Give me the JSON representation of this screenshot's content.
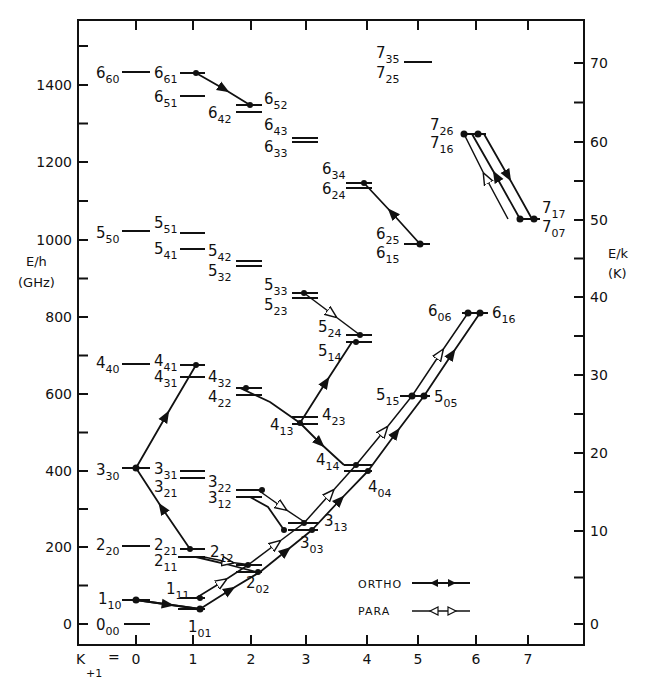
{
  "chart_data": {
    "type": "energy-level-diagram",
    "title": "",
    "x_axis": {
      "label": "K+1 =",
      "ticks": [
        "0",
        "1",
        "2",
        "3",
        "4",
        "5",
        "6",
        "7"
      ]
    },
    "y_axis_left": {
      "label": "E/h",
      "unit": "(GHz)",
      "ticks": [
        "0",
        "200",
        "400",
        "600",
        "800",
        "1000",
        "1200",
        "1400"
      ],
      "range": [
        -50,
        1560
      ]
    },
    "y_axis_right": {
      "label": "E/k",
      "unit": "(K)",
      "ticks": [
        "0",
        "10",
        "20",
        "30",
        "40",
        "50",
        "60",
        "70"
      ]
    },
    "legend": [
      {
        "name": "ORTHO",
        "style": "filled-arrows"
      },
      {
        "name": "PARA",
        "style": "open-arrows"
      }
    ],
    "levels": [
      {
        "J": "0",
        "sub": "00",
        "E_GHz": 0,
        "K": 0
      },
      {
        "J": "1",
        "sub": "10",
        "E_GHz": 60,
        "K": 0
      },
      {
        "J": "1",
        "sub": "11",
        "E_GHz": 68,
        "K": 1
      },
      {
        "J": "1",
        "sub": "01",
        "E_GHz": 36,
        "K": 1
      },
      {
        "J": "2",
        "sub": "20",
        "E_GHz": 203,
        "K": 0
      },
      {
        "J": "2",
        "sub": "21",
        "E_GHz": 195,
        "K": 1
      },
      {
        "J": "2",
        "sub": "11",
        "E_GHz": 171,
        "K": 1
      },
      {
        "J": "2",
        "sub": "12",
        "E_GHz": 153,
        "K": 2
      },
      {
        "J": "2",
        "sub": "02",
        "E_GHz": 132,
        "K": 2
      },
      {
        "J": "3",
        "sub": "30",
        "E_GHz": 404,
        "K": 0
      },
      {
        "J": "3",
        "sub": "31",
        "E_GHz": 397,
        "K": 1
      },
      {
        "J": "3",
        "sub": "21",
        "E_GHz": 376,
        "K": 1
      },
      {
        "J": "3",
        "sub": "22",
        "E_GHz": 342,
        "K": 2
      },
      {
        "J": "3",
        "sub": "12",
        "E_GHz": 327,
        "K": 2
      },
      {
        "J": "3",
        "sub": "13",
        "E_GHz": 262,
        "K": 3
      },
      {
        "J": "3",
        "sub": "03",
        "E_GHz": 244,
        "K": 3
      },
      {
        "J": "4",
        "sub": "40",
        "E_GHz": 674,
        "K": 0
      },
      {
        "J": "4",
        "sub": "41",
        "E_GHz": 674,
        "K": 1
      },
      {
        "J": "4",
        "sub": "31",
        "E_GHz": 640,
        "K": 1
      },
      {
        "J": "4",
        "sub": "32",
        "E_GHz": 612,
        "K": 2
      },
      {
        "J": "4",
        "sub": "22",
        "E_GHz": 596,
        "K": 2
      },
      {
        "J": "4",
        "sub": "23",
        "E_GHz": 537,
        "K": 3
      },
      {
        "J": "4",
        "sub": "13",
        "E_GHz": 521,
        "K": 3
      },
      {
        "J": "4",
        "sub": "14",
        "E_GHz": 412,
        "K": 4
      },
      {
        "J": "4",
        "sub": "04",
        "E_GHz": 399,
        "K": 4
      },
      {
        "J": "5",
        "sub": "50",
        "E_GHz": 1019,
        "K": 0
      },
      {
        "J": "5",
        "sub": "51",
        "E_GHz": 1014,
        "K": 1
      },
      {
        "J": "5",
        "sub": "41",
        "E_GHz": 972,
        "K": 1
      },
      {
        "J": "5",
        "sub": "42",
        "E_GHz": 939,
        "K": 2
      },
      {
        "J": "5",
        "sub": "32",
        "E_GHz": 931,
        "K": 2
      },
      {
        "J": "5",
        "sub": "33",
        "E_GHz": 858,
        "K": 3
      },
      {
        "J": "5",
        "sub": "23",
        "E_GHz": 848,
        "K": 3
      },
      {
        "J": "5",
        "sub": "24",
        "E_GHz": 750,
        "K": 4
      },
      {
        "J": "5",
        "sub": "14",
        "E_GHz": 731,
        "K": 4
      },
      {
        "J": "5",
        "sub": "15",
        "E_GHz": 591,
        "K": 5
      },
      {
        "J": "5",
        "sub": "05",
        "E_GHz": 591,
        "K": 5
      },
      {
        "J": "6",
        "sub": "60",
        "E_GHz": 1431,
        "K": 0
      },
      {
        "J": "6",
        "sub": "61",
        "E_GHz": 1431,
        "K": 1
      },
      {
        "J": "6",
        "sub": "51",
        "E_GHz": 1369,
        "K": 1
      },
      {
        "J": "6",
        "sub": "52",
        "E_GHz": 1345,
        "K": 2
      },
      {
        "J": "6",
        "sub": "42",
        "E_GHz": 1327,
        "K": 2
      },
      {
        "J": "6",
        "sub": "43",
        "E_GHz": 1260,
        "K": 3
      },
      {
        "J": "6",
        "sub": "33",
        "E_GHz": 1250,
        "K": 3
      },
      {
        "J": "6",
        "sub": "34",
        "E_GHz": 1143,
        "K": 4
      },
      {
        "J": "6",
        "sub": "24",
        "E_GHz": 1130,
        "K": 4
      },
      {
        "J": "6",
        "sub": "25",
        "E_GHz": 985,
        "K": 5
      },
      {
        "J": "6",
        "sub": "15",
        "E_GHz": 985,
        "K": 5
      },
      {
        "J": "6",
        "sub": "06",
        "E_GHz": 806,
        "K": 6
      },
      {
        "J": "6",
        "sub": "16",
        "E_GHz": 806,
        "K": 6
      },
      {
        "J": "7",
        "sub": "35",
        "E_GHz": 1457,
        "K": 5
      },
      {
        "J": "7",
        "sub": "25",
        "E_GHz": 1457,
        "K": 5
      },
      {
        "J": "7",
        "sub": "26",
        "E_GHz": 1270,
        "K": 6
      },
      {
        "J": "7",
        "sub": "16",
        "E_GHz": 1270,
        "K": 6
      },
      {
        "J": "7",
        "sub": "17",
        "E_GHz": 1050,
        "K": 7
      },
      {
        "J": "7",
        "sub": "07",
        "E_GHz": 1050,
        "K": 7
      }
    ]
  },
  "axes": {
    "left_ticks": [
      {
        "label": "0",
        "y": 624
      },
      {
        "label": "200",
        "y": 547
      },
      {
        "label": "400",
        "y": 471
      },
      {
        "label": "600",
        "y": 394
      },
      {
        "label": "800",
        "y": 317
      },
      {
        "label": "1000",
        "y": 240
      },
      {
        "label": "1200",
        "y": 162
      },
      {
        "label": "1400",
        "y": 85
      }
    ],
    "right_ticks": [
      {
        "label": "0",
        "y": 624
      },
      {
        "label": "10",
        "y": 531
      },
      {
        "label": "20",
        "y": 453
      },
      {
        "label": "30",
        "y": 375
      },
      {
        "label": "40",
        "y": 297
      },
      {
        "label": "50",
        "y": 220
      },
      {
        "label": "60",
        "y": 142
      },
      {
        "label": "70",
        "y": 63
      }
    ],
    "x_ticks": [
      {
        "label": "0",
        "x": 136
      },
      {
        "label": "1",
        "x": 193
      },
      {
        "label": "2",
        "x": 251
      },
      {
        "label": "3",
        "x": 306
      },
      {
        "label": "4",
        "x": 367
      },
      {
        "label": "5",
        "x": 418
      },
      {
        "label": "6",
        "x": 476
      },
      {
        "label": "7",
        "x": 528
      }
    ],
    "left_label": "E/h",
    "left_unit": "(GHz)",
    "right_label": "E/k",
    "right_unit": "(K)",
    "x_label_main": "K",
    "x_label_sub": "+1",
    "x_label_eq": "="
  },
  "legend": {
    "ortho": "ORTHO",
    "para": "PARA"
  }
}
